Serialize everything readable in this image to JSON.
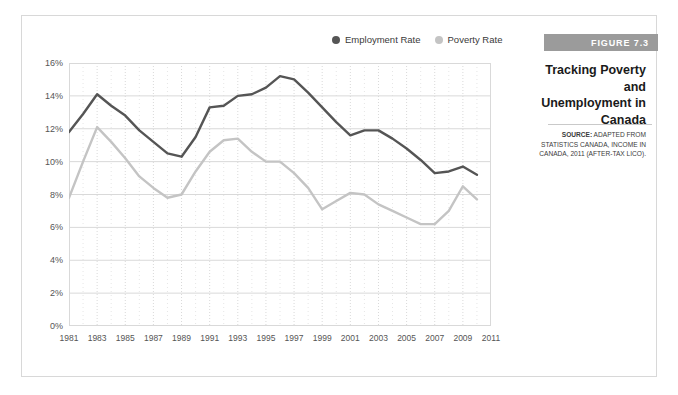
{
  "figure": {
    "band_label": "FIGURE 7.3",
    "title": "Tracking Poverty and Unemployment in Canada",
    "source_prefix": "SOURCE:",
    "source_text": " ADAPTED FROM STATISTICS CANADA, INCOME IN CANADA, 2011 (AFTER-TAX LICO)."
  },
  "colors": {
    "employment_line": "#555555",
    "poverty_line": "#c4c4c4",
    "grid": "#d9d9d9",
    "minor_grid": "#e6e6e6",
    "axis_text": "#555555",
    "band": "#9b9b9b",
    "frame": "#d8d8d8"
  },
  "chart_data": {
    "type": "line",
    "title": "Tracking Poverty and Unemployment in Canada",
    "xlabel": "",
    "ylabel": "",
    "ylim": [
      0,
      16
    ],
    "xlim": [
      1981,
      2011
    ],
    "ytick_labels": [
      "0%",
      "2%",
      "4%",
      "6%",
      "8%",
      "10%",
      "12%",
      "14%",
      "16%"
    ],
    "ytick_values": [
      0,
      2,
      4,
      6,
      8,
      10,
      12,
      14,
      16
    ],
    "xtick_labels": [
      "1981",
      "1983",
      "1985",
      "1987",
      "1989",
      "1991",
      "1993",
      "1995",
      "1997",
      "1999",
      "2001",
      "2003",
      "2005",
      "2007",
      "2009",
      "2011"
    ],
    "xtick_values": [
      1981,
      1983,
      1985,
      1987,
      1989,
      1991,
      1993,
      1995,
      1997,
      1999,
      2001,
      2003,
      2005,
      2007,
      2009,
      2011
    ],
    "grid": true,
    "legend_position": "top",
    "x": [
      1981,
      1982,
      1983,
      1984,
      1985,
      1986,
      1987,
      1988,
      1989,
      1990,
      1991,
      1992,
      1993,
      1994,
      1995,
      1996,
      1997,
      1998,
      1999,
      2000,
      2001,
      2002,
      2003,
      2004,
      2005,
      2006,
      2007,
      2008,
      2009,
      2010
    ],
    "series": [
      {
        "name": "Employment Rate",
        "color": "#555555",
        "values": [
          11.8,
          12.9,
          14.1,
          13.4,
          12.8,
          11.9,
          11.2,
          10.5,
          10.3,
          11.5,
          13.3,
          13.4,
          14.0,
          14.1,
          14.5,
          15.2,
          15.0,
          14.2,
          13.3,
          12.4,
          11.6,
          11.9,
          11.9,
          11.4,
          10.8,
          10.1,
          9.3,
          9.4,
          9.7,
          9.2
        ]
      },
      {
        "name": "Poverty Rate",
        "color": "#c4c4c4",
        "values": [
          7.8,
          10.0,
          12.1,
          11.2,
          10.2,
          9.1,
          8.4,
          7.8,
          8.0,
          9.4,
          10.6,
          11.3,
          11.4,
          10.6,
          10.0,
          10.0,
          9.3,
          8.4,
          7.1,
          7.6,
          8.1,
          8.0,
          7.4,
          7.0,
          6.6,
          6.2,
          6.2,
          7.0,
          8.5,
          7.7
        ]
      }
    ],
    "legend": [
      {
        "label": "Employment Rate",
        "color": "#555555"
      },
      {
        "label": "Poverty Rate",
        "color": "#c4c4c4"
      }
    ]
  }
}
